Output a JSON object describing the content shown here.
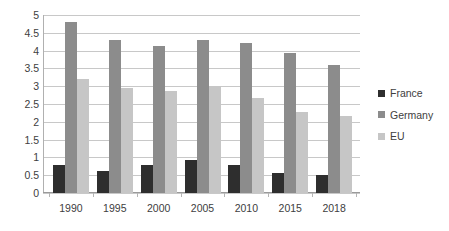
{
  "chart_data": {
    "type": "bar",
    "title": "",
    "subtitle": "",
    "xlabel": "",
    "ylabel": "",
    "categories": [
      "1990",
      "1995",
      "2000",
      "2005",
      "2010",
      "2015",
      "2018"
    ],
    "series": [
      {
        "name": "France",
        "color": "#2e2e2e",
        "values": [
          0.8,
          0.62,
          0.8,
          0.92,
          0.8,
          0.55,
          0.52
        ]
      },
      {
        "name": "Germany",
        "color": "#8c8c8c",
        "values": [
          4.79,
          4.3,
          4.12,
          4.29,
          4.2,
          3.93,
          3.59
        ]
      },
      {
        "name": "EU",
        "color": "#c6c6c6",
        "values": [
          3.21,
          2.95,
          2.87,
          3.02,
          2.68,
          2.28,
          2.17
        ]
      }
    ],
    "ylim": [
      0,
      5
    ],
    "yticks": [
      "0",
      "0.5",
      "1",
      "1.5",
      "2",
      "2.5",
      "3",
      "3.5",
      "4",
      "4.5",
      "5"
    ],
    "grid": "horizontal",
    "legend_position": "right",
    "legend": [
      "France",
      "Germany",
      "EU"
    ]
  }
}
